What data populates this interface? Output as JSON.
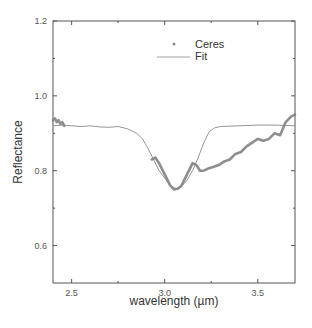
{
  "chart_data": {
    "type": "line",
    "title": "",
    "xlabel": "wavelength (µm)",
    "ylabel": "Reflectance",
    "xlim": [
      2.4,
      3.7
    ],
    "ylim": [
      0.5,
      1.2
    ],
    "x_ticks": [
      2.5,
      3.0,
      3.5
    ],
    "x_tick_labels": [
      "2.5",
      "3.0",
      "3.5"
    ],
    "x_minor_ticks": [
      2.75,
      3.25
    ],
    "y_ticks": [
      0.6,
      0.8,
      1.0,
      1.2
    ],
    "y_tick_labels": [
      "0.6",
      "0.8",
      "1.0",
      "1.2"
    ],
    "y_minor_ticks": [
      0.7,
      0.9,
      1.1
    ],
    "grid": false,
    "legend_position": "upper right (inside)",
    "series": [
      {
        "name": "Ceres",
        "style": "points",
        "color": "#7a7a7a",
        "segments": [
          {
            "x": [
              2.4,
              2.41,
              2.42,
              2.43,
              2.44,
              2.45,
              2.46
            ],
            "y": [
              0.935,
              0.94,
              0.93,
              0.935,
              0.925,
              0.93,
              0.92
            ]
          },
          {
            "x": [
              2.93,
              2.95,
              2.97,
              2.99,
              3.01,
              3.03,
              3.05,
              3.07,
              3.09,
              3.11,
              3.13,
              3.15,
              3.17,
              3.19,
              3.21,
              3.23,
              3.26,
              3.29,
              3.32,
              3.35,
              3.38,
              3.41,
              3.44,
              3.47,
              3.5,
              3.53,
              3.56,
              3.59,
              3.62,
              3.65,
              3.68,
              3.7
            ],
            "y": [
              0.83,
              0.835,
              0.82,
              0.8,
              0.78,
              0.76,
              0.75,
              0.752,
              0.76,
              0.78,
              0.8,
              0.82,
              0.815,
              0.8,
              0.8,
              0.805,
              0.81,
              0.815,
              0.825,
              0.83,
              0.845,
              0.85,
              0.865,
              0.875,
              0.885,
              0.88,
              0.885,
              0.9,
              0.895,
              0.93,
              0.945,
              0.95
            ]
          }
        ]
      },
      {
        "name": "Fit",
        "style": "line",
        "color": "#888888",
        "x": [
          2.4,
          2.45,
          2.5,
          2.55,
          2.6,
          2.65,
          2.7,
          2.75,
          2.8,
          2.85,
          2.88,
          2.91,
          2.94,
          2.97,
          3.0,
          3.03,
          3.06,
          3.09,
          3.12,
          3.15,
          3.18,
          3.21,
          3.24,
          3.27,
          3.3,
          3.4,
          3.5,
          3.6,
          3.7
        ],
        "y": [
          0.92,
          0.922,
          0.92,
          0.918,
          0.92,
          0.917,
          0.916,
          0.918,
          0.912,
          0.9,
          0.885,
          0.86,
          0.83,
          0.8,
          0.78,
          0.76,
          0.752,
          0.757,
          0.775,
          0.8,
          0.835,
          0.875,
          0.905,
          0.915,
          0.918,
          0.92,
          0.922,
          0.922,
          0.92
        ]
      }
    ]
  },
  "legend": {
    "items": [
      {
        "label": "Ceres",
        "marker": "dot"
      },
      {
        "label": "Fit",
        "marker": "line"
      }
    ]
  },
  "axes": {
    "xlabel": "wavelength (µm)",
    "ylabel": "Reflectance"
  }
}
